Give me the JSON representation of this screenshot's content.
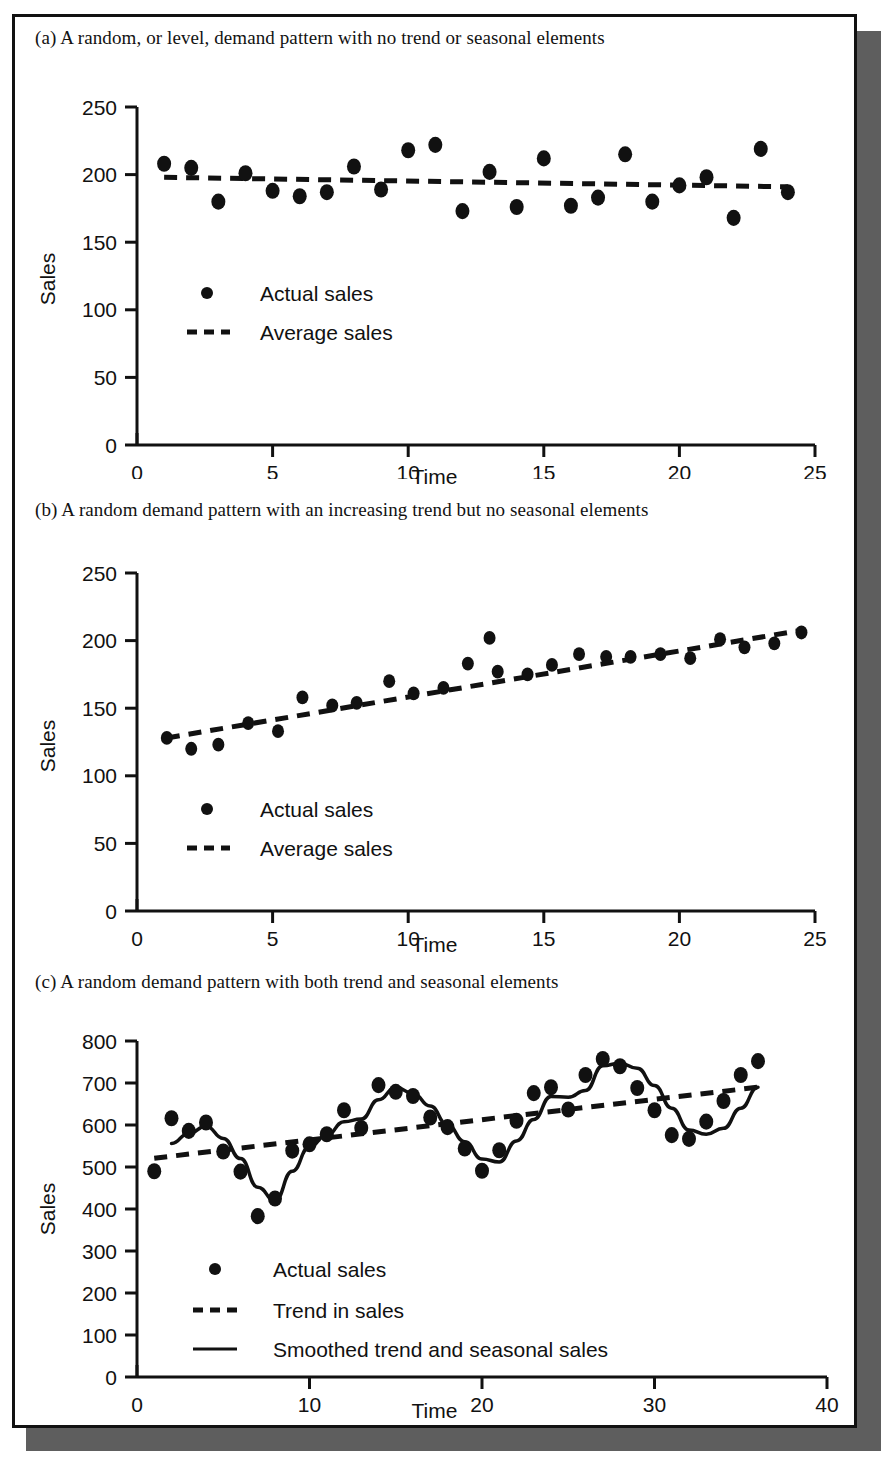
{
  "figure": {
    "panels": [
      {
        "id": "a",
        "caption": "(a) A random, or level, demand pattern with no trend or seasonal elements",
        "xlabel": "Time",
        "ylabel": "Sales",
        "legend": [
          {
            "marker": "dot",
            "label": "Actual sales"
          },
          {
            "marker": "dashed-line",
            "label": "Average sales"
          }
        ],
        "xticks": [
          "0",
          "5",
          "10",
          "15",
          "20",
          "25"
        ],
        "yticks": [
          "0",
          "50",
          "100",
          "150",
          "200",
          "250"
        ]
      },
      {
        "id": "b",
        "caption": "(b) A random demand pattern with an increasing trend but no seasonal elements",
        "xlabel": "Time",
        "ylabel": "Sales",
        "legend": [
          {
            "marker": "dot",
            "label": "Actual sales"
          },
          {
            "marker": "dashed-line",
            "label": "Average sales"
          }
        ],
        "xticks": [
          "0",
          "5",
          "10",
          "15",
          "20",
          "25"
        ],
        "yticks": [
          "0",
          "50",
          "100",
          "150",
          "200",
          "250"
        ]
      },
      {
        "id": "c",
        "caption": "(c) A random demand pattern with both trend and seasonal elements",
        "xlabel": "Time",
        "ylabel": "Sales",
        "legend": [
          {
            "marker": "dot",
            "label": "Actual sales"
          },
          {
            "marker": "dashed-line",
            "label": "Trend in sales"
          },
          {
            "marker": "solid-line",
            "label": "Smoothed trend and seasonal sales"
          }
        ],
        "xticks": [
          "0",
          "10",
          "20",
          "30",
          "40"
        ],
        "yticks": [
          "0",
          "100",
          "200",
          "300",
          "400",
          "500",
          "600",
          "700",
          "800"
        ]
      }
    ]
  },
  "chart_data": [
    {
      "type": "scatter",
      "panel": "a",
      "title": "(a) A random, or level, demand pattern with no trend or seasonal elements",
      "xlabel": "Time",
      "ylabel": "Sales",
      "xlim": [
        0,
        25
      ],
      "ylim": [
        0,
        250
      ],
      "xticks": [
        0,
        5,
        10,
        15,
        20,
        25
      ],
      "yticks": [
        0,
        50,
        100,
        150,
        200,
        250
      ],
      "grid": false,
      "legend_position": "inside-left",
      "series": [
        {
          "name": "Actual sales",
          "style": "dot",
          "x": [
            1,
            2,
            3,
            4,
            5,
            6,
            7,
            8,
            9,
            10,
            11,
            12,
            13,
            14,
            15,
            16,
            17,
            18,
            19,
            20,
            21,
            22,
            23,
            24
          ],
          "values": [
            208,
            205,
            180,
            201,
            188,
            184,
            187,
            206,
            189,
            218,
            222,
            173,
            202,
            176,
            212,
            177,
            183,
            215,
            180,
            192,
            198,
            168,
            219,
            187
          ]
        },
        {
          "name": "Average sales",
          "style": "dashed-line",
          "x": [
            1,
            24
          ],
          "values": [
            198,
            191
          ]
        }
      ]
    },
    {
      "type": "scatter",
      "panel": "b",
      "title": "(b) A random demand pattern with an increasing trend but no seasonal elements",
      "xlabel": "Time",
      "ylabel": "Sales",
      "xlim": [
        0,
        25
      ],
      "ylim": [
        0,
        250
      ],
      "xticks": [
        0,
        5,
        10,
        15,
        20,
        25
      ],
      "yticks": [
        0,
        50,
        100,
        150,
        200,
        250
      ],
      "grid": false,
      "legend_position": "inside-left",
      "series": [
        {
          "name": "Actual sales",
          "style": "dot",
          "x": [
            1.1,
            2.0,
            3.0,
            4.1,
            5.2,
            6.1,
            7.2,
            8.1,
            9.3,
            10.2,
            11.3,
            12.2,
            13.0,
            13.3,
            14.4,
            15.3,
            16.3,
            17.3,
            18.2,
            19.3,
            20.4,
            21.5,
            22.4,
            23.5,
            24.5
          ],
          "values": [
            128,
            120,
            123,
            139,
            133,
            158,
            152,
            154,
            170,
            161,
            165,
            183,
            202,
            177,
            175,
            182,
            190,
            188,
            188,
            190,
            187,
            201,
            195,
            198,
            206
          ]
        },
        {
          "name": "Average sales",
          "style": "dashed-line",
          "x": [
            1.1,
            24.6
          ],
          "values": [
            128,
            208
          ]
        }
      ]
    },
    {
      "type": "line",
      "panel": "c",
      "title": "(c) A random demand pattern with both trend and seasonal elements",
      "xlabel": "Time",
      "ylabel": "Sales",
      "xlim": [
        0,
        40
      ],
      "ylim": [
        0,
        800
      ],
      "xticks": [
        0,
        10,
        20,
        30,
        40
      ],
      "yticks": [
        0,
        100,
        200,
        300,
        400,
        500,
        600,
        700,
        800
      ],
      "grid": false,
      "legend_position": "inside-left",
      "series": [
        {
          "name": "Actual sales",
          "style": "dot",
          "x": [
            1,
            2,
            3,
            4,
            5,
            6,
            7,
            8,
            9,
            10,
            11,
            12,
            13,
            14,
            15,
            16,
            17,
            18,
            19,
            20,
            21,
            22,
            23,
            24,
            25,
            26,
            27,
            28,
            29,
            30,
            31,
            32,
            33,
            34,
            35,
            36
          ],
          "values": [
            490,
            616,
            586,
            606,
            537,
            489,
            383,
            425,
            539,
            554,
            578,
            635,
            593,
            695,
            679,
            669,
            618,
            595,
            544,
            491,
            540,
            610,
            676,
            690,
            637,
            719,
            757,
            740,
            688,
            635,
            576,
            567,
            608,
            657,
            719,
            752
          ]
        },
        {
          "name": "Trend in sales",
          "style": "dashed-line",
          "x": [
            1,
            36
          ],
          "values": [
            521,
            690
          ]
        },
        {
          "name": "Smoothed trend and seasonal sales",
          "style": "solid-line",
          "x": [
            2,
            3,
            4,
            5,
            6,
            7,
            8,
            9,
            10,
            11,
            12,
            13,
            14,
            15,
            16,
            17,
            18,
            19,
            20,
            21,
            22,
            23,
            24,
            25,
            26,
            27,
            28,
            29,
            30,
            31,
            32,
            33,
            34,
            35,
            36
          ],
          "values": [
            556,
            580,
            597,
            568,
            520,
            452,
            420,
            490,
            548,
            576,
            608,
            614,
            660,
            690,
            675,
            645,
            600,
            560,
            519,
            512,
            562,
            613,
            668,
            666,
            682,
            741,
            747,
            735,
            694,
            640,
            588,
            578,
            592,
            640,
            690
          ]
        }
      ]
    }
  ]
}
